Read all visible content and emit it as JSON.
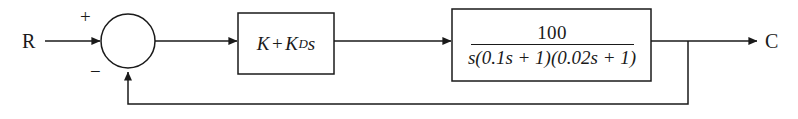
{
  "diagram": {
    "type": "control-system-block-diagram",
    "stroke_color": "#1a1a1a",
    "background_color": "#ffffff",
    "signals": {
      "input_label": "R",
      "output_label": "C"
    },
    "summing_junction": {
      "shape": "circle",
      "positive_sign": "+",
      "negative_sign": "−",
      "positive_input": "R",
      "negative_input": "feedback"
    },
    "blocks": [
      {
        "id": "controller",
        "name": "controller-block",
        "expression": "K + K_D s",
        "gain_term": "K",
        "operator": "+",
        "derivative_gain": "K",
        "derivative_subscript": "D",
        "laplace_variable": "s"
      },
      {
        "id": "plant",
        "name": "plant-block",
        "expression": "100 / (s(0.1s + 1)(0.02s + 1))",
        "numerator": "100",
        "denominator_prefix": "s",
        "denominator": "s(0.1s + 1)(0.02s + 1)",
        "denominator_parts": [
          {
            "coefficient": "0.1",
            "variable": "s",
            "constant": "1"
          },
          {
            "coefficient": "0.02",
            "variable": "s",
            "constant": "1"
          }
        ]
      }
    ],
    "feedback": {
      "path": "unity",
      "description": "output takeoff to negative summing input"
    }
  }
}
